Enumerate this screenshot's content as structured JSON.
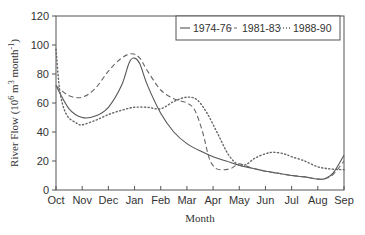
{
  "chart_data": {
    "type": "line",
    "title": "",
    "xlabel": "Month",
    "ylabel": "River Flow (10^6 m^3 month^-1)",
    "ylim": [
      0,
      120
    ],
    "yticks": [
      0,
      20,
      40,
      60,
      80,
      100,
      120
    ],
    "categories": [
      "Oct",
      "Nov",
      "Dec",
      "Jan",
      "Feb",
      "Mar",
      "Apr",
      "May",
      "Jun",
      "Jul",
      "Aug",
      "Sep"
    ],
    "grid": false,
    "legend_position": "top-right",
    "series": [
      {
        "name": "1974-76",
        "style": "solid",
        "values": [
          72,
          50,
          57,
          91,
          53,
          32,
          23,
          17,
          13,
          10,
          7.5,
          24
        ],
        "dense": [
          [
            0,
            72
          ],
          [
            0.5,
            56
          ],
          [
            1,
            50
          ],
          [
            1.5,
            51
          ],
          [
            2,
            57
          ],
          [
            2.5,
            72
          ],
          [
            2.8,
            88
          ],
          [
            3,
            91
          ],
          [
            3.2,
            87
          ],
          [
            3.5,
            72
          ],
          [
            4,
            53
          ],
          [
            4.5,
            40
          ],
          [
            5,
            32
          ],
          [
            5.5,
            27
          ],
          [
            6,
            23
          ],
          [
            6.5,
            20
          ],
          [
            7,
            17
          ],
          [
            7.5,
            15
          ],
          [
            8,
            13
          ],
          [
            8.5,
            11.5
          ],
          [
            9,
            10
          ],
          [
            9.5,
            9
          ],
          [
            10,
            7.5
          ],
          [
            10.3,
            8
          ],
          [
            10.6,
            12
          ],
          [
            11,
            24
          ]
        ]
      },
      {
        "name": "1981-83",
        "style": "dashed",
        "values": [
          72,
          64,
          82,
          93,
          69,
          60,
          15,
          18,
          13,
          10,
          7.5,
          20
        ],
        "dense": [
          [
            0,
            72
          ],
          [
            0.5,
            65
          ],
          [
            1,
            64
          ],
          [
            1.5,
            70
          ],
          [
            2,
            82
          ],
          [
            2.5,
            91
          ],
          [
            2.9,
            94
          ],
          [
            3.2,
            91
          ],
          [
            3.5,
            82
          ],
          [
            4,
            69
          ],
          [
            4.5,
            63
          ],
          [
            5,
            60
          ],
          [
            5.3,
            55
          ],
          [
            5.6,
            40
          ],
          [
            5.85,
            22
          ],
          [
            6.1,
            15
          ],
          [
            6.4,
            14
          ],
          [
            6.7,
            15
          ],
          [
            7,
            18
          ],
          [
            7.5,
            15
          ],
          [
            8,
            13
          ],
          [
            8.5,
            11.5
          ],
          [
            9,
            10
          ],
          [
            9.5,
            9
          ],
          [
            10,
            7.5
          ],
          [
            10.3,
            8
          ],
          [
            10.6,
            11
          ],
          [
            11,
            20
          ]
        ]
      },
      {
        "name": "1988-90",
        "style": "dotted",
        "values": [
          97,
          45,
          52,
          57,
          56,
          64,
          33,
          17,
          25,
          23,
          16,
          14
        ],
        "dense": [
          [
            0,
            97
          ],
          [
            0.15,
            68
          ],
          [
            0.4,
            52
          ],
          [
            0.8,
            46
          ],
          [
            1,
            45
          ],
          [
            1.5,
            48
          ],
          [
            2,
            52
          ],
          [
            2.5,
            55
          ],
          [
            3,
            57
          ],
          [
            3.5,
            57
          ],
          [
            4,
            56
          ],
          [
            4.5,
            61
          ],
          [
            5,
            64
          ],
          [
            5.4,
            62
          ],
          [
            5.8,
            52
          ],
          [
            6.2,
            38
          ],
          [
            6.6,
            24
          ],
          [
            7,
            17
          ],
          [
            7.3,
            18
          ],
          [
            7.6,
            22
          ],
          [
            8,
            25
          ],
          [
            8.3,
            26
          ],
          [
            8.7,
            25
          ],
          [
            9,
            23
          ],
          [
            9.5,
            20
          ],
          [
            10,
            16
          ],
          [
            10.5,
            14.5
          ],
          [
            11,
            14
          ]
        ]
      }
    ]
  }
}
